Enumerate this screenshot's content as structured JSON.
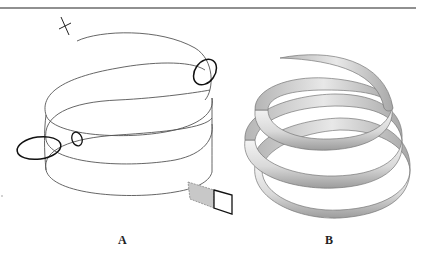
{
  "figure": {
    "panels": [
      {
        "id": "A",
        "label": "A",
        "description": "Wireframe helix path with profile circles and sweep rectangle"
      },
      {
        "id": "B",
        "label": "B",
        "description": "Shaded 3D tapered helical sweep solid"
      }
    ],
    "colors": {
      "line": "#555555",
      "profile": "#111111",
      "shade_light": "#ececec",
      "shade_dark": "#9a9a9a",
      "rect_fill": "#c8c8c8"
    }
  }
}
